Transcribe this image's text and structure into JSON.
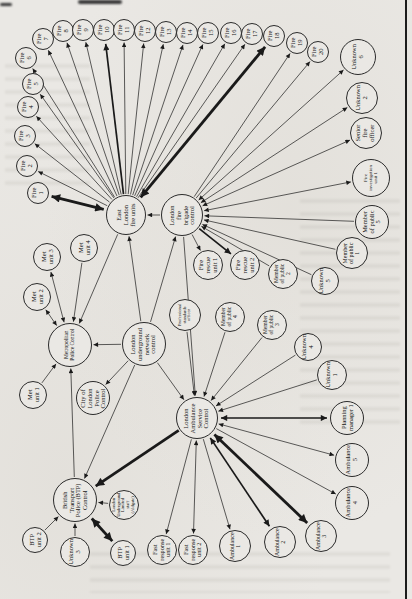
{
  "page": {
    "ink": "#1a1a1a",
    "paper": "#eae8e4",
    "edge_line_color": "#1c1c1c"
  },
  "diagram": {
    "nodes": [
      {
        "id": "fire1",
        "label": "Fire\n1",
        "x": 38,
        "y": 193,
        "r": 11
      },
      {
        "id": "fire2",
        "label": "Fire\n2",
        "x": 27,
        "y": 166,
        "r": 11
      },
      {
        "id": "fire3",
        "label": "Fire\n3",
        "x": 25,
        "y": 136,
        "r": 11
      },
      {
        "id": "fire4",
        "label": "Fire\n4",
        "x": 28,
        "y": 107,
        "r": 11
      },
      {
        "id": "fire5",
        "label": "Fire\n5",
        "x": 33,
        "y": 84,
        "r": 11
      },
      {
        "id": "fire6",
        "label": "Fire\n6",
        "x": 26,
        "y": 58,
        "r": 11
      },
      {
        "id": "fire7",
        "label": "Fire\n7",
        "x": 43,
        "y": 39,
        "r": 11
      },
      {
        "id": "fire8",
        "label": "Fire\n8",
        "x": 63,
        "y": 31,
        "r": 11
      },
      {
        "id": "fire9",
        "label": "Fire\n9",
        "x": 83,
        "y": 30,
        "r": 11
      },
      {
        "id": "fire10",
        "label": "Fire\n10",
        "x": 104,
        "y": 30,
        "r": 11
      },
      {
        "id": "fire11",
        "label": "Fire\n11",
        "x": 124,
        "y": 30,
        "r": 11
      },
      {
        "id": "fire12",
        "label": "Fire\n12",
        "x": 145,
        "y": 31,
        "r": 11
      },
      {
        "id": "fire13",
        "label": "Fire\n13",
        "x": 166,
        "y": 32,
        "r": 11
      },
      {
        "id": "fire14",
        "label": "Fire\n14",
        "x": 187,
        "y": 33,
        "r": 11
      },
      {
        "id": "fire15",
        "label": "Fire\n15",
        "x": 208,
        "y": 33,
        "r": 11
      },
      {
        "id": "fire16",
        "label": "Fire\n16",
        "x": 231,
        "y": 33,
        "r": 11
      },
      {
        "id": "fire17",
        "label": "Fire\n17",
        "x": 252,
        "y": 34,
        "r": 11
      },
      {
        "id": "fire18",
        "label": "Fire\n18",
        "x": 274,
        "y": 36,
        "r": 11
      },
      {
        "id": "fire19",
        "label": "Fire\n19",
        "x": 297,
        "y": 43,
        "r": 11
      },
      {
        "id": "fire20",
        "label": "Fire\n20",
        "x": 318,
        "y": 52,
        "r": 11
      },
      {
        "id": "unknown6",
        "label": "Unknown\n6",
        "x": 358,
        "y": 57,
        "r": 18
      },
      {
        "id": "unknown2",
        "label": "Unknown\n2",
        "x": 362,
        "y": 98,
        "r": 16
      },
      {
        "id": "sfo",
        "label": "Senior\nfire\nofficer",
        "x": 366,
        "y": 133,
        "r": 16
      },
      {
        "id": "fiu1",
        "label": "Fire\ninvestigation\nunit 1",
        "x": 371,
        "y": 178,
        "r": 19
      },
      {
        "id": "mop5",
        "label": "Member\nof public\n5",
        "x": 372,
        "y": 222,
        "r": 17
      },
      {
        "id": "mop1",
        "label": "Member\nof public\n1",
        "x": 352,
        "y": 253,
        "r": 16
      },
      {
        "id": "unknown5",
        "label": "Unknown\n5",
        "x": 325,
        "y": 281,
        "r": 14
      },
      {
        "id": "elfu",
        "label": "East\nLondon\nfire units",
        "x": 126,
        "y": 215,
        "r": 20
      },
      {
        "id": "lfbc",
        "label": "London\nfire\nbrigade\ncontrol",
        "x": 182,
        "y": 215,
        "r": 21
      },
      {
        "id": "fru1",
        "label": "Fire\nrescue\nunit 1",
        "x": 208,
        "y": 265,
        "r": 15
      },
      {
        "id": "fru2",
        "label": "Fire\nrescue\nunit 2",
        "x": 245,
        "y": 265,
        "r": 15
      },
      {
        "id": "mop2",
        "label": "Member\nof public\n2",
        "x": 283,
        "y": 274,
        "r": 15
      },
      {
        "id": "met3",
        "label": "Met\nunit 3",
        "x": 47,
        "y": 257,
        "r": 14
      },
      {
        "id": "met4",
        "label": "Met\nunit 4",
        "x": 84,
        "y": 248,
        "r": 14
      },
      {
        "id": "met2",
        "label": "Met\nunit 2",
        "x": 37,
        "y": 297,
        "r": 14
      },
      {
        "id": "met1",
        "label": "Met\nunit 1",
        "x": 33,
        "y": 395,
        "r": 14
      },
      {
        "id": "mpc",
        "label": "Metropolitan\nPolice Control",
        "x": 70,
        "y": 345,
        "r": 22
      },
      {
        "id": "lu",
        "label": "London\nunderground\nnetwork\ncontrol",
        "x": 144,
        "y": 344,
        "r": 22
      },
      {
        "id": "colpc",
        "label": "City of\nLondon\nPolice\nControl",
        "x": 93,
        "y": 398,
        "r": 17
      },
      {
        "id": "pso",
        "label": "Professional\nstandards\nofficer",
        "x": 185,
        "y": 315,
        "r": 16
      },
      {
        "id": "mop4",
        "label": "Member\nof public\n4",
        "x": 230,
        "y": 317,
        "r": 15
      },
      {
        "id": "mop3",
        "label": "Member\nof public\n3",
        "x": 272,
        "y": 325,
        "r": 15
      },
      {
        "id": "unknown4",
        "label": "Unknown\n4",
        "x": 308,
        "y": 347,
        "r": 14
      },
      {
        "id": "unknown1",
        "label": "Unknown\n1",
        "x": 332,
        "y": 375,
        "r": 15
      },
      {
        "id": "lasc",
        "label": "London\nAmbulance\nService\nControl",
        "x": 197,
        "y": 418,
        "r": 21
      },
      {
        "id": "pm1",
        "label": "Planning\nmanager 1",
        "x": 347,
        "y": 418,
        "r": 17
      },
      {
        "id": "amb5",
        "label": "Ambulance\n5",
        "x": 352,
        "y": 460,
        "r": 17
      },
      {
        "id": "amb4",
        "label": "Ambulance\n4",
        "x": 352,
        "y": 503,
        "r": 17
      },
      {
        "id": "amb3",
        "label": "Ambulance\n3",
        "x": 321,
        "y": 536,
        "r": 16
      },
      {
        "id": "amb2",
        "label": "Ambulance\n2",
        "x": 280,
        "y": 542,
        "r": 16
      },
      {
        "id": "amb1",
        "label": "Ambulance\n1",
        "x": 235,
        "y": 546,
        "r": 16
      },
      {
        "id": "fr2",
        "label": "Fast\nresponse\nunit 2",
        "x": 193,
        "y": 550,
        "r": 15
      },
      {
        "id": "fr1",
        "label": "Fast\nresponse\nunit 1",
        "x": 162,
        "y": 550,
        "r": 15
      },
      {
        "id": "btp",
        "label": "British\nTransport\nPolice (BTP)\nControl",
        "x": 75,
        "y": 500,
        "r": 22
      },
      {
        "id": "aldgate",
        "label": "London\nUnderground\nLimited\nstaff\n(Aldgate)",
        "x": 124,
        "y": 505,
        "r": 15
      },
      {
        "id": "btpu2",
        "label": "BTP\nunit 2",
        "x": 35,
        "y": 540,
        "r": 13
      },
      {
        "id": "unknown3",
        "label": "Unknown\n3",
        "x": 75,
        "y": 552,
        "r": 15
      },
      {
        "id": "btpu1",
        "label": "BTP\nunit 1",
        "x": 123,
        "y": 553,
        "r": 13
      }
    ],
    "edges": [
      {
        "from": "elfu",
        "to": "fire1",
        "dir": "both",
        "w": 3
      },
      {
        "from": "elfu",
        "to": "fire2",
        "dir": "fwd",
        "w": 1
      },
      {
        "from": "elfu",
        "to": "fire3",
        "dir": "fwd",
        "w": 1
      },
      {
        "from": "elfu",
        "to": "fire4",
        "dir": "fwd",
        "w": 1
      },
      {
        "from": "elfu",
        "to": "fire5",
        "dir": "fwd",
        "w": 1
      },
      {
        "from": "elfu",
        "to": "fire6",
        "dir": "fwd",
        "w": 1
      },
      {
        "from": "elfu",
        "to": "fire7",
        "dir": "fwd",
        "w": 1
      },
      {
        "from": "elfu",
        "to": "fire8",
        "dir": "fwd",
        "w": 1
      },
      {
        "from": "elfu",
        "to": "fire9",
        "dir": "fwd",
        "w": 1
      },
      {
        "from": "elfu",
        "to": "fire10",
        "dir": "fwd",
        "w": 2
      },
      {
        "from": "elfu",
        "to": "fire11",
        "dir": "fwd",
        "w": 1
      },
      {
        "from": "elfu",
        "to": "fire12",
        "dir": "fwd",
        "w": 1
      },
      {
        "from": "elfu",
        "to": "fire13",
        "dir": "fwd",
        "w": 1
      },
      {
        "from": "elfu",
        "to": "fire14",
        "dir": "fwd",
        "w": 1
      },
      {
        "from": "elfu",
        "to": "fire15",
        "dir": "fwd",
        "w": 1
      },
      {
        "from": "elfu",
        "to": "fire16",
        "dir": "fwd",
        "w": 1
      },
      {
        "from": "elfu",
        "to": "fire17",
        "dir": "fwd",
        "w": 1
      },
      {
        "from": "elfu",
        "to": "fire18",
        "dir": "both",
        "w": 3
      },
      {
        "from": "lfbc",
        "to": "fire19",
        "dir": "fwd",
        "w": 1
      },
      {
        "from": "lfbc",
        "to": "fire20",
        "dir": "fwd",
        "w": 1
      },
      {
        "from": "unknown6",
        "to": "lfbc",
        "dir": "both",
        "w": 1
      },
      {
        "from": "unknown2",
        "to": "lfbc",
        "dir": "both",
        "w": 1
      },
      {
        "from": "sfo",
        "to": "lfbc",
        "dir": "both",
        "w": 1
      },
      {
        "from": "fiu1",
        "to": "lfbc",
        "dir": "both",
        "w": 1
      },
      {
        "from": "mop5",
        "to": "lfbc",
        "dir": "fwd",
        "w": 1
      },
      {
        "from": "mop1",
        "to": "lfbc",
        "dir": "fwd",
        "w": 1
      },
      {
        "from": "unknown5",
        "to": "lfbc",
        "dir": "fwd",
        "w": 1
      },
      {
        "from": "mop2",
        "to": "lfbc",
        "dir": "fwd",
        "w": 1
      },
      {
        "from": "lfbc",
        "to": "fru1",
        "dir": "fwd",
        "w": 1
      },
      {
        "from": "lfbc",
        "to": "fru2",
        "dir": "fwd",
        "w": 2
      },
      {
        "from": "lfbc",
        "to": "elfu",
        "dir": "fwd",
        "w": 1
      },
      {
        "from": "lu",
        "to": "lfbc",
        "dir": "fwd",
        "w": 1
      },
      {
        "from": "lu",
        "to": "elfu",
        "dir": "fwd",
        "w": 1
      },
      {
        "from": "elfu",
        "to": "mpc",
        "dir": "fwd",
        "w": 1
      },
      {
        "from": "lfbc",
        "to": "lasc",
        "dir": "fwd",
        "w": 1
      },
      {
        "from": "met3",
        "to": "mpc",
        "dir": "both",
        "w": 1
      },
      {
        "from": "met2",
        "to": "mpc",
        "dir": "both",
        "w": 1
      },
      {
        "from": "met4",
        "to": "mpc",
        "dir": "fwd",
        "w": 1
      },
      {
        "from": "met1",
        "to": "mpc",
        "dir": "fwd",
        "w": 1
      },
      {
        "from": "lu",
        "to": "mpc",
        "dir": "fwd",
        "w": 1
      },
      {
        "from": "btp",
        "to": "mpc",
        "dir": "fwd",
        "w": 1
      },
      {
        "from": "lu",
        "to": "colpc",
        "dir": "fwd",
        "w": 1
      },
      {
        "from": "lu",
        "to": "btp",
        "dir": "fwd",
        "w": 1
      },
      {
        "from": "lu",
        "to": "lasc",
        "dir": "fwd",
        "w": 1
      },
      {
        "from": "pso",
        "to": "lasc",
        "dir": "fwd",
        "w": 1
      },
      {
        "from": "mop4",
        "to": "lasc",
        "dir": "fwd",
        "w": 1
      },
      {
        "from": "mop3",
        "to": "lasc",
        "dir": "fwd",
        "w": 1
      },
      {
        "from": "unknown4",
        "to": "lasc",
        "dir": "fwd",
        "w": 1
      },
      {
        "from": "unknown1",
        "to": "lasc",
        "dir": "fwd",
        "w": 1
      },
      {
        "from": "lasc",
        "to": "pm1",
        "dir": "both",
        "w": 2
      },
      {
        "from": "lasc",
        "to": "amb5",
        "dir": "both",
        "w": 1
      },
      {
        "from": "lasc",
        "to": "amb4",
        "dir": "fwd",
        "w": 1
      },
      {
        "from": "lasc",
        "to": "amb3",
        "dir": "both",
        "w": 3
      },
      {
        "from": "lasc",
        "to": "amb2",
        "dir": "both",
        "w": 2
      },
      {
        "from": "lasc",
        "to": "amb1",
        "dir": "fwd",
        "w": 1
      },
      {
        "from": "lasc",
        "to": "fr2",
        "dir": "both",
        "w": 1
      },
      {
        "from": "lasc",
        "to": "fr1",
        "dir": "fwd",
        "w": 1
      },
      {
        "from": "lasc",
        "to": "btp",
        "dir": "fwd",
        "w": 3
      },
      {
        "from": "btpu2",
        "to": "btp",
        "dir": "fwd",
        "w": 1
      },
      {
        "from": "unknown3",
        "to": "btp",
        "dir": "fwd",
        "w": 1
      },
      {
        "from": "aldgate",
        "to": "btp",
        "dir": "fwd",
        "w": 1
      },
      {
        "from": "btp",
        "to": "btpu1",
        "dir": "both",
        "w": 3
      }
    ]
  }
}
